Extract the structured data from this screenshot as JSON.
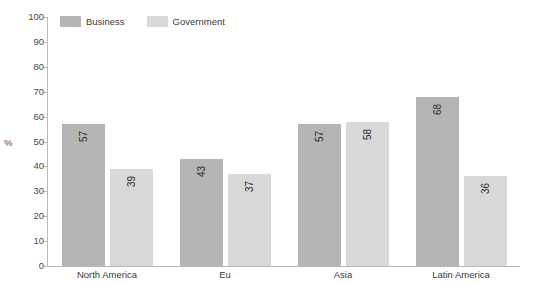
{
  "chart_data": {
    "type": "bar",
    "title": "",
    "xlabel": "",
    "ylabel": "%",
    "ylim": [
      0,
      100
    ],
    "ytick_step": 10,
    "ytick_labels": [
      "100",
      "90",
      "80",
      "70",
      "60",
      "50",
      "40",
      "30",
      "20",
      "10",
      "0"
    ],
    "grid": false,
    "legend_position": "top-left",
    "categories": [
      "North America",
      "Eu",
      "Asia",
      "Latin America"
    ],
    "series": [
      {
        "name": "Business",
        "color": "#b5b5b5",
        "values": [
          57,
          43,
          57,
          68
        ]
      },
      {
        "name": "Government",
        "color": "#d9d9d9",
        "values": [
          39,
          37,
          58,
          36
        ]
      }
    ],
    "value_labels_rotated": true
  },
  "top_remnant": "",
  "legend": {
    "items": [
      {
        "label": "Business"
      },
      {
        "label": "Government"
      }
    ]
  }
}
